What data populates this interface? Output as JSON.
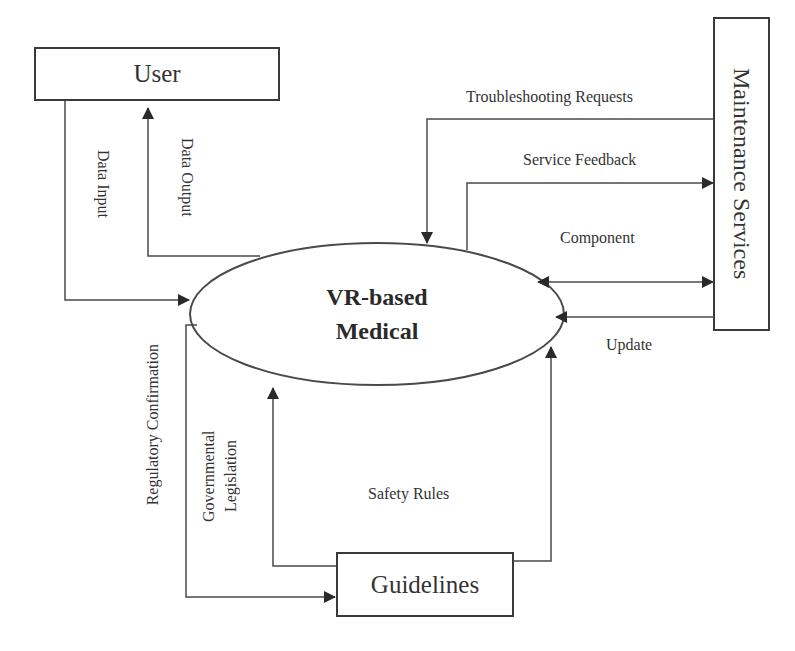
{
  "diagram": {
    "type": "context-diagram",
    "central_process": {
      "line1": "VR-based",
      "line2": "Medical"
    },
    "entities": {
      "user": {
        "label": "User"
      },
      "maintenance": {
        "label": "Maintenance Services"
      },
      "guidelines": {
        "label": "Guidelines"
      }
    },
    "flows": {
      "data_input": {
        "label": "Data Input",
        "from": "User",
        "to": "VR-based Medical"
      },
      "data_output": {
        "label": "Data Output",
        "from": "VR-based Medical",
        "to": "User"
      },
      "troubleshooting": {
        "label": "Troubleshooting Requests",
        "from": "Maintenance Services",
        "to": "VR-based Medical"
      },
      "service_feedback": {
        "label": "Service Feedback",
        "from": "VR-based Medical",
        "to": "Maintenance Services"
      },
      "component": {
        "label": "Component",
        "direction": "bidirectional"
      },
      "update": {
        "label": "Update",
        "from": "Maintenance Services",
        "to": "VR-based Medical"
      },
      "regulatory": {
        "label": "Regulatory Confirmation",
        "from": "VR-based Medical",
        "to": "Guidelines"
      },
      "governmental": {
        "line1": "Governmental",
        "line2": "Legislation",
        "from": "Guidelines",
        "to": "VR-based Medical"
      },
      "safety_rules": {
        "label": "Safety Rules",
        "from": "Guidelines",
        "to": "VR-based Medical"
      }
    },
    "colors": {
      "line": "#3a3a3a",
      "text": "#333333",
      "background": "#ffffff"
    }
  }
}
